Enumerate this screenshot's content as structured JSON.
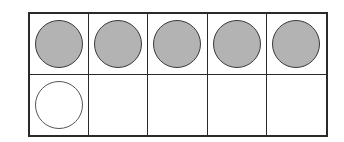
{
  "ten_frame": {
    "rows": 2,
    "columns": 5,
    "cells": [
      {
        "row": 0,
        "col": 0,
        "counter": "filled"
      },
      {
        "row": 0,
        "col": 1,
        "counter": "filled"
      },
      {
        "row": 0,
        "col": 2,
        "counter": "filled"
      },
      {
        "row": 0,
        "col": 3,
        "counter": "filled"
      },
      {
        "row": 0,
        "col": 4,
        "counter": "filled"
      },
      {
        "row": 1,
        "col": 0,
        "counter": "empty"
      },
      {
        "row": 1,
        "col": 1,
        "counter": "none"
      },
      {
        "row": 1,
        "col": 2,
        "counter": "none"
      },
      {
        "row": 1,
        "col": 3,
        "counter": "none"
      },
      {
        "row": 1,
        "col": 4,
        "counter": "none"
      }
    ],
    "filled_count": 5,
    "empty_counter_count": 1,
    "colors": {
      "filled": "#b3b3b3",
      "outline": "#2a2a2a",
      "background": "#ffffff"
    }
  }
}
